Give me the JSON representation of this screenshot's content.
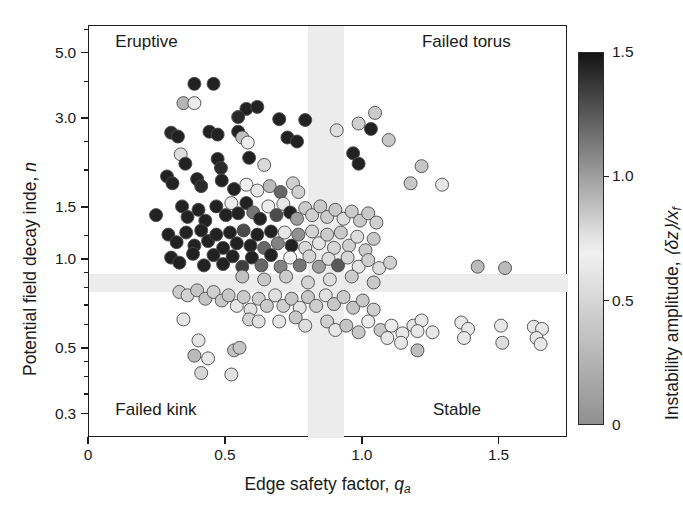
{
  "figure": {
    "background": "#ffffff",
    "frame_color": "#1d1d1d",
    "band_color": "#ececec"
  },
  "axes": {
    "x_title_main": "Edge safety factor, ",
    "x_title_sym": "q",
    "x_title_sub": "a",
    "y_title_main": "Potential field decay inde, ",
    "y_title_sym": "n",
    "x_ticklabels": [
      "0",
      "0.5",
      "1.0",
      "1.5"
    ],
    "x_tickvalues": [
      0,
      0.5,
      1.0,
      1.5
    ],
    "y_ticklabels": [
      "5.0",
      "3.0",
      "1.5",
      "1.0",
      "0.5",
      "0.3"
    ],
    "y_tickvalues": [
      5.0,
      3.0,
      1.5,
      1.0,
      0.5,
      0.3
    ]
  },
  "quadrant_labels": [
    {
      "name": "eruptive",
      "text": "Eruptive"
    },
    {
      "name": "failed-torus",
      "text": "Failed torus"
    },
    {
      "name": "failed-kink",
      "text": "Failed kink"
    },
    {
      "name": "stable",
      "text": "Stable"
    }
  ],
  "colorbar": {
    "title_main": "Instability amplitude, ",
    "title_sym": "⟨δz⟩/x",
    "title_sub": "f",
    "ticklabels": [
      "1.5",
      "1.0",
      "0.5",
      "0"
    ],
    "tickvalues": [
      1.5,
      1.0,
      0.5,
      0
    ],
    "vmin": 0,
    "vmax": 1.5
  },
  "chart_data": {
    "type": "scatter",
    "title": "",
    "xlabel": "Edge safety factor, q_a",
    "ylabel": "Potential field decay index, n",
    "xscale": "linear",
    "yscale": "log",
    "xlim": [
      0,
      1.75
    ],
    "ylim": [
      0.25,
      6.2
    ],
    "grid": false,
    "colorbar_label": "Instability amplitude, <dz>/x_f",
    "cmap_note": "grayscale: dark=high amplitude (1.5), light=mid (~0.7), medium-gray=low (0)",
    "marker_size_px": 13,
    "marker_edge_color": "#4a4a4a",
    "shaded_bands": [
      {
        "orientation": "vertical",
        "x_range": [
          0.8,
          0.93
        ],
        "color": "#ececec"
      },
      {
        "orientation": "horizontal",
        "y_range": [
          0.78,
          0.9
        ],
        "color": "#ececec"
      }
    ],
    "quadrant_annotations": [
      {
        "text": "Eruptive",
        "x": 0.1,
        "y": 5.4
      },
      {
        "text": "Failed torus",
        "x": 1.22,
        "y": 5.4
      },
      {
        "text": "Failed kink",
        "x": 0.1,
        "y": 0.305
      },
      {
        "text": "Stable",
        "x": 1.26,
        "y": 0.305
      }
    ],
    "points": [
      {
        "x": 0.385,
        "y": 3.95,
        "c": 1.45
      },
      {
        "x": 0.455,
        "y": 3.95,
        "c": 1.45
      },
      {
        "x": 0.345,
        "y": 3.4,
        "c": 0.92
      },
      {
        "x": 0.385,
        "y": 3.4,
        "c": 0.72
      },
      {
        "x": 0.575,
        "y": 3.25,
        "c": 1.45
      },
      {
        "x": 0.615,
        "y": 3.3,
        "c": 1.45
      },
      {
        "x": 0.545,
        "y": 3.05,
        "c": 1.42
      },
      {
        "x": 0.695,
        "y": 3.0,
        "c": 1.45
      },
      {
        "x": 0.79,
        "y": 2.98,
        "c": 1.45
      },
      {
        "x": 0.545,
        "y": 2.72,
        "c": 1.45
      },
      {
        "x": 0.3,
        "y": 2.7,
        "c": 1.42
      },
      {
        "x": 0.325,
        "y": 2.62,
        "c": 1.45
      },
      {
        "x": 0.44,
        "y": 2.72,
        "c": 1.45
      },
      {
        "x": 0.47,
        "y": 2.66,
        "c": 1.45
      },
      {
        "x": 0.56,
        "y": 2.6,
        "c": 0.88
      },
      {
        "x": 0.58,
        "y": 2.5,
        "c": 0.72
      },
      {
        "x": 0.725,
        "y": 2.6,
        "c": 1.45
      },
      {
        "x": 0.76,
        "y": 2.52,
        "c": 1.45
      },
      {
        "x": 0.905,
        "y": 2.75,
        "c": 0.55
      },
      {
        "x": 0.335,
        "y": 2.28,
        "c": 0.55
      },
      {
        "x": 0.352,
        "y": 2.12,
        "c": 1.45
      },
      {
        "x": 0.47,
        "y": 2.2,
        "c": 1.45
      },
      {
        "x": 0.482,
        "y": 2.05,
        "c": 1.42
      },
      {
        "x": 0.585,
        "y": 2.22,
        "c": 1.45
      },
      {
        "x": 0.64,
        "y": 2.1,
        "c": 0.52
      },
      {
        "x": 1.045,
        "y": 3.15,
        "c": 0.42
      },
      {
        "x": 0.985,
        "y": 2.9,
        "c": 0.45
      },
      {
        "x": 1.03,
        "y": 2.78,
        "c": 1.45
      },
      {
        "x": 1.095,
        "y": 2.55,
        "c": 0.4
      },
      {
        "x": 0.965,
        "y": 2.3,
        "c": 1.45
      },
      {
        "x": 0.985,
        "y": 2.12,
        "c": 1.45
      },
      {
        "x": 1.215,
        "y": 2.08,
        "c": 0.38
      },
      {
        "x": 1.175,
        "y": 1.82,
        "c": 0.4
      },
      {
        "x": 1.29,
        "y": 1.8,
        "c": 0.62
      },
      {
        "x": 0.285,
        "y": 1.92,
        "c": 1.45
      },
      {
        "x": 0.305,
        "y": 1.82,
        "c": 1.45
      },
      {
        "x": 0.395,
        "y": 1.88,
        "c": 1.45
      },
      {
        "x": 0.41,
        "y": 1.78,
        "c": 1.42
      },
      {
        "x": 0.485,
        "y": 1.86,
        "c": 1.45
      },
      {
        "x": 0.53,
        "y": 1.74,
        "c": 1.45
      },
      {
        "x": 0.575,
        "y": 1.8,
        "c": 0.68
      },
      {
        "x": 0.615,
        "y": 1.72,
        "c": 0.62
      },
      {
        "x": 0.66,
        "y": 1.78,
        "c": 0.9
      },
      {
        "x": 0.7,
        "y": 1.7,
        "c": 1.2
      },
      {
        "x": 0.745,
        "y": 1.82,
        "c": 0.45
      },
      {
        "x": 0.765,
        "y": 1.7,
        "c": 0.45
      },
      {
        "x": 0.245,
        "y": 1.42,
        "c": 1.45
      },
      {
        "x": 0.34,
        "y": 1.52,
        "c": 1.45
      },
      {
        "x": 0.36,
        "y": 1.4,
        "c": 1.45
      },
      {
        "x": 0.4,
        "y": 1.48,
        "c": 1.45
      },
      {
        "x": 0.425,
        "y": 1.36,
        "c": 1.45
      },
      {
        "x": 0.465,
        "y": 1.52,
        "c": 1.45
      },
      {
        "x": 0.5,
        "y": 1.42,
        "c": 1.45
      },
      {
        "x": 0.52,
        "y": 1.56,
        "c": 0.66
      },
      {
        "x": 0.545,
        "y": 1.44,
        "c": 1.45
      },
      {
        "x": 0.575,
        "y": 1.56,
        "c": 1.45
      },
      {
        "x": 0.6,
        "y": 1.45,
        "c": 1.15
      },
      {
        "x": 0.625,
        "y": 1.38,
        "c": 1.45
      },
      {
        "x": 0.655,
        "y": 1.52,
        "c": 0.72
      },
      {
        "x": 0.685,
        "y": 1.42,
        "c": 1.3
      },
      {
        "x": 0.71,
        "y": 1.55,
        "c": 0.62
      },
      {
        "x": 0.735,
        "y": 1.45,
        "c": 1.45
      },
      {
        "x": 0.76,
        "y": 1.38,
        "c": 1.0
      },
      {
        "x": 0.79,
        "y": 1.5,
        "c": 0.42
      },
      {
        "x": 0.815,
        "y": 1.42,
        "c": 0.45
      },
      {
        "x": 0.845,
        "y": 1.52,
        "c": 0.4
      },
      {
        "x": 0.87,
        "y": 1.4,
        "c": 0.42
      },
      {
        "x": 0.9,
        "y": 1.48,
        "c": 0.4
      },
      {
        "x": 0.93,
        "y": 1.38,
        "c": 0.55
      },
      {
        "x": 0.96,
        "y": 1.46,
        "c": 0.42
      },
      {
        "x": 0.99,
        "y": 1.36,
        "c": 0.85
      },
      {
        "x": 1.02,
        "y": 1.44,
        "c": 0.4
      },
      {
        "x": 1.05,
        "y": 1.34,
        "c": 0.45
      },
      {
        "x": 0.29,
        "y": 1.22,
        "c": 1.45
      },
      {
        "x": 0.32,
        "y": 1.15,
        "c": 1.45
      },
      {
        "x": 0.355,
        "y": 1.24,
        "c": 1.45
      },
      {
        "x": 0.385,
        "y": 1.12,
        "c": 1.45
      },
      {
        "x": 0.41,
        "y": 1.26,
        "c": 1.45
      },
      {
        "x": 0.435,
        "y": 1.16,
        "c": 1.45
      },
      {
        "x": 0.465,
        "y": 1.22,
        "c": 1.45
      },
      {
        "x": 0.49,
        "y": 1.1,
        "c": 1.45
      },
      {
        "x": 0.515,
        "y": 1.24,
        "c": 1.45
      },
      {
        "x": 0.54,
        "y": 1.14,
        "c": 1.45
      },
      {
        "x": 0.565,
        "y": 1.26,
        "c": 1.3
      },
      {
        "x": 0.59,
        "y": 1.12,
        "c": 1.45
      },
      {
        "x": 0.615,
        "y": 1.22,
        "c": 1.45
      },
      {
        "x": 0.64,
        "y": 1.1,
        "c": 1.2
      },
      {
        "x": 0.665,
        "y": 1.25,
        "c": 1.45
      },
      {
        "x": 0.69,
        "y": 1.14,
        "c": 1.1
      },
      {
        "x": 0.715,
        "y": 1.24,
        "c": 0.62
      },
      {
        "x": 0.74,
        "y": 1.12,
        "c": 1.45
      },
      {
        "x": 0.765,
        "y": 1.22,
        "c": 1.05
      },
      {
        "x": 0.79,
        "y": 1.1,
        "c": 0.52
      },
      {
        "x": 0.815,
        "y": 1.25,
        "c": 0.48
      },
      {
        "x": 0.84,
        "y": 1.14,
        "c": 0.6
      },
      {
        "x": 0.87,
        "y": 1.22,
        "c": 0.42
      },
      {
        "x": 0.895,
        "y": 1.1,
        "c": 0.5
      },
      {
        "x": 0.92,
        "y": 1.24,
        "c": 0.4
      },
      {
        "x": 0.95,
        "y": 1.12,
        "c": 0.45
      },
      {
        "x": 0.98,
        "y": 1.2,
        "c": 0.78
      },
      {
        "x": 1.01,
        "y": 1.08,
        "c": 0.42
      },
      {
        "x": 1.04,
        "y": 1.18,
        "c": 0.4
      },
      {
        "x": 0.3,
        "y": 1.02,
        "c": 1.45
      },
      {
        "x": 0.33,
        "y": 0.98,
        "c": 1.45
      },
      {
        "x": 0.38,
        "y": 1.05,
        "c": 1.45
      },
      {
        "x": 0.42,
        "y": 0.96,
        "c": 1.45
      },
      {
        "x": 0.455,
        "y": 1.04,
        "c": 1.45
      },
      {
        "x": 0.49,
        "y": 0.97,
        "c": 1.45
      },
      {
        "x": 0.525,
        "y": 1.03,
        "c": 1.45
      },
      {
        "x": 0.56,
        "y": 0.95,
        "c": 1.35
      },
      {
        "x": 0.595,
        "y": 1.02,
        "c": 1.45
      },
      {
        "x": 0.63,
        "y": 0.96,
        "c": 1.2
      },
      {
        "x": 0.665,
        "y": 1.04,
        "c": 1.45
      },
      {
        "x": 0.7,
        "y": 0.95,
        "c": 1.1
      },
      {
        "x": 0.735,
        "y": 1.02,
        "c": 0.7
      },
      {
        "x": 0.77,
        "y": 0.96,
        "c": 1.15
      },
      {
        "x": 0.805,
        "y": 1.03,
        "c": 0.48
      },
      {
        "x": 0.84,
        "y": 0.95,
        "c": 1.0
      },
      {
        "x": 0.875,
        "y": 1.01,
        "c": 0.55
      },
      {
        "x": 0.91,
        "y": 0.96,
        "c": 1.25
      },
      {
        "x": 0.945,
        "y": 1.02,
        "c": 0.5
      },
      {
        "x": 0.985,
        "y": 0.95,
        "c": 0.6
      },
      {
        "x": 1.02,
        "y": 1.0,
        "c": 0.45
      },
      {
        "x": 1.06,
        "y": 0.94,
        "c": 0.55
      },
      {
        "x": 1.1,
        "y": 0.98,
        "c": 0.45
      },
      {
        "x": 1.42,
        "y": 0.95,
        "c": 0.3
      },
      {
        "x": 1.52,
        "y": 0.94,
        "c": 0.3
      },
      {
        "x": 0.56,
        "y": 0.88,
        "c": 0.35
      },
      {
        "x": 0.64,
        "y": 0.86,
        "c": 0.4
      },
      {
        "x": 0.72,
        "y": 0.88,
        "c": 0.42
      },
      {
        "x": 0.8,
        "y": 0.84,
        "c": 0.48
      },
      {
        "x": 0.88,
        "y": 0.86,
        "c": 0.55
      },
      {
        "x": 0.96,
        "y": 0.88,
        "c": 0.42
      },
      {
        "x": 1.04,
        "y": 0.84,
        "c": 0.4
      },
      {
        "x": 0.33,
        "y": 0.78,
        "c": 0.42
      },
      {
        "x": 0.36,
        "y": 0.76,
        "c": 0.48
      },
      {
        "x": 0.395,
        "y": 0.79,
        "c": 0.38
      },
      {
        "x": 0.425,
        "y": 0.74,
        "c": 0.38
      },
      {
        "x": 0.455,
        "y": 0.78,
        "c": 0.45
      },
      {
        "x": 0.485,
        "y": 0.73,
        "c": 0.4
      },
      {
        "x": 0.51,
        "y": 0.76,
        "c": 0.4
      },
      {
        "x": 0.54,
        "y": 0.7,
        "c": 0.62
      },
      {
        "x": 0.565,
        "y": 0.75,
        "c": 0.42
      },
      {
        "x": 0.59,
        "y": 0.68,
        "c": 0.58
      },
      {
        "x": 0.62,
        "y": 0.74,
        "c": 0.45
      },
      {
        "x": 0.65,
        "y": 0.7,
        "c": 0.42
      },
      {
        "x": 0.68,
        "y": 0.76,
        "c": 0.58
      },
      {
        "x": 0.71,
        "y": 0.7,
        "c": 0.45
      },
      {
        "x": 0.74,
        "y": 0.74,
        "c": 0.4
      },
      {
        "x": 0.77,
        "y": 0.69,
        "c": 0.6
      },
      {
        "x": 0.8,
        "y": 0.75,
        "c": 0.4
      },
      {
        "x": 0.83,
        "y": 0.7,
        "c": 0.45
      },
      {
        "x": 0.865,
        "y": 0.76,
        "c": 0.58
      },
      {
        "x": 0.895,
        "y": 0.71,
        "c": 0.4
      },
      {
        "x": 0.93,
        "y": 0.75,
        "c": 0.42
      },
      {
        "x": 0.965,
        "y": 0.69,
        "c": 0.38
      },
      {
        "x": 1.0,
        "y": 0.73,
        "c": 0.4
      },
      {
        "x": 1.04,
        "y": 0.68,
        "c": 0.45
      },
      {
        "x": 0.345,
        "y": 0.63,
        "c": 0.6
      },
      {
        "x": 0.585,
        "y": 0.63,
        "c": 0.48
      },
      {
        "x": 0.62,
        "y": 0.62,
        "c": 0.58
      },
      {
        "x": 0.695,
        "y": 0.62,
        "c": 0.6
      },
      {
        "x": 0.755,
        "y": 0.64,
        "c": 0.4
      },
      {
        "x": 0.79,
        "y": 0.6,
        "c": 0.55
      },
      {
        "x": 0.87,
        "y": 0.62,
        "c": 0.45
      },
      {
        "x": 0.9,
        "y": 0.58,
        "c": 0.62
      },
      {
        "x": 0.94,
        "y": 0.6,
        "c": 0.38
      },
      {
        "x": 0.985,
        "y": 0.57,
        "c": 0.4
      },
      {
        "x": 1.02,
        "y": 0.62,
        "c": 0.65
      },
      {
        "x": 1.065,
        "y": 0.58,
        "c": 0.4
      },
      {
        "x": 0.4,
        "y": 0.535,
        "c": 0.6
      },
      {
        "x": 0.385,
        "y": 0.475,
        "c": 0.3
      },
      {
        "x": 0.435,
        "y": 0.465,
        "c": 0.62
      },
      {
        "x": 0.41,
        "y": 0.415,
        "c": 0.5
      },
      {
        "x": 0.53,
        "y": 0.495,
        "c": 0.35
      },
      {
        "x": 0.55,
        "y": 0.505,
        "c": 0.38
      },
      {
        "x": 0.52,
        "y": 0.41,
        "c": 0.58
      },
      {
        "x": 1.105,
        "y": 0.6,
        "c": 0.65
      },
      {
        "x": 1.145,
        "y": 0.565,
        "c": 0.62
      },
      {
        "x": 1.185,
        "y": 0.6,
        "c": 0.6
      },
      {
        "x": 1.215,
        "y": 0.625,
        "c": 0.62
      },
      {
        "x": 1.2,
        "y": 0.575,
        "c": 0.62
      },
      {
        "x": 1.09,
        "y": 0.545,
        "c": 0.62
      },
      {
        "x": 1.14,
        "y": 0.525,
        "c": 0.62
      },
      {
        "x": 1.255,
        "y": 0.57,
        "c": 0.62
      },
      {
        "x": 1.2,
        "y": 0.495,
        "c": 0.32
      },
      {
        "x": 1.36,
        "y": 0.615,
        "c": 0.62
      },
      {
        "x": 1.385,
        "y": 0.585,
        "c": 0.62
      },
      {
        "x": 1.37,
        "y": 0.545,
        "c": 0.62
      },
      {
        "x": 1.505,
        "y": 0.6,
        "c": 0.62
      },
      {
        "x": 1.51,
        "y": 0.525,
        "c": 0.55
      },
      {
        "x": 1.625,
        "y": 0.595,
        "c": 0.62
      },
      {
        "x": 1.655,
        "y": 0.585,
        "c": 0.62
      },
      {
        "x": 1.635,
        "y": 0.545,
        "c": 0.62
      },
      {
        "x": 1.65,
        "y": 0.52,
        "c": 0.62
      }
    ]
  }
}
